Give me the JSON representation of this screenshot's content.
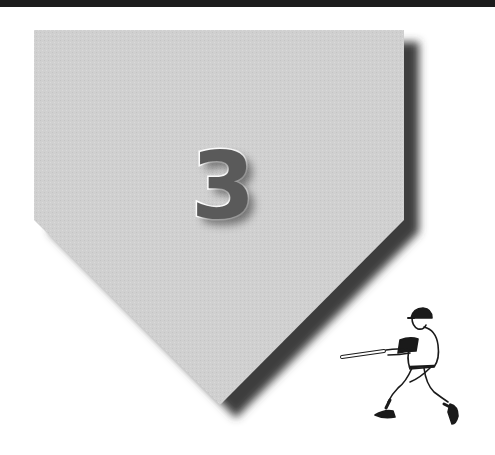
{
  "chapter": {
    "number": "3"
  },
  "plate": {
    "fill_color": "#cfcfcf",
    "shadow_color": "#3e3e3e"
  },
  "illustration": {
    "subject": "baseball-batter-swinging"
  }
}
